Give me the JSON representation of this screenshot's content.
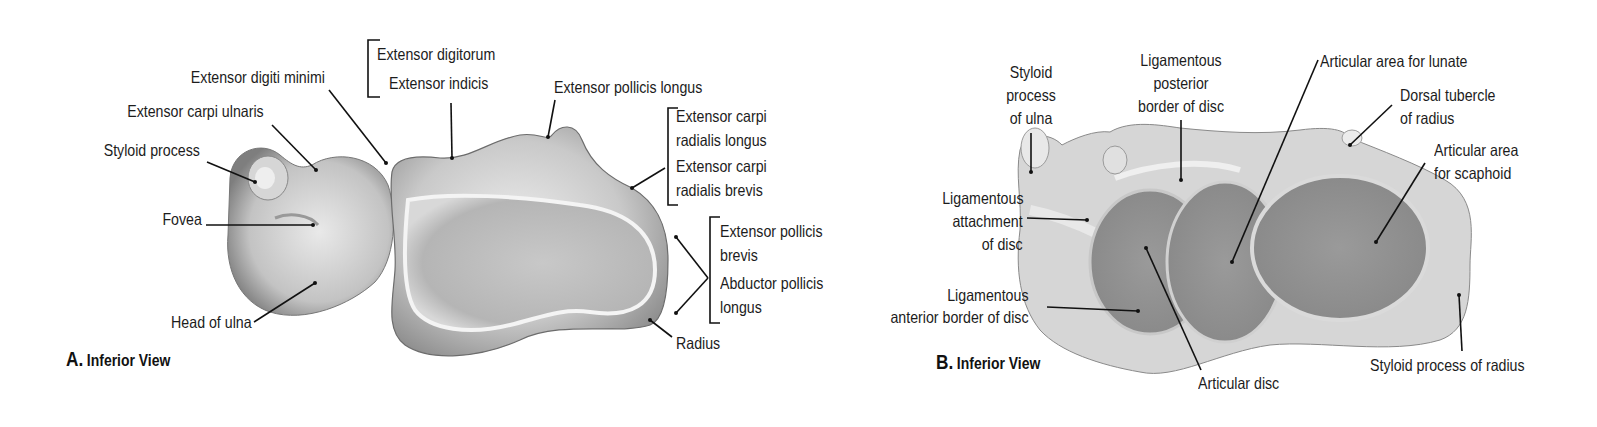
{
  "panel_a": {
    "caption_letter": "A.",
    "caption_view": "Inferior View",
    "labels": {
      "extensor_digitorum": "Extensor digitorum",
      "extensor_indicis": "Extensor indicis",
      "extensor_digiti_minimi": "Extensor digiti minimi",
      "extensor_carpi_ulnaris": "Extensor carpi ulnaris",
      "styloid_process": "Styloid process",
      "fovea": "Fovea",
      "head_of_ulna": "Head of ulna",
      "extensor_pollicis_longus": "Extensor pollicis longus",
      "ecrl_line1": "Extensor carpi",
      "ecrl_line2": "radialis longus",
      "ecrb_line1": "Extensor carpi",
      "ecrb_line2": "radialis brevis",
      "epb_line1": "Extensor pollicis",
      "epb_line2": "brevis",
      "apl_line1": "Abductor pollicis",
      "apl_line2": "longus",
      "radius": "Radius"
    }
  },
  "panel_b": {
    "caption_letter": "B.",
    "caption_view": "Inferior View",
    "labels": {
      "styloid_ulna_line1": "Styloid",
      "styloid_ulna_line2": "process",
      "styloid_ulna_line3": "of ulna",
      "lig_post_line1": "Ligamentous",
      "lig_post_line2": "posterior",
      "lig_post_line3": "border of disc",
      "articular_lunate": "Articular area for lunate",
      "dorsal_tubercle_line1": "Dorsal tubercle",
      "dorsal_tubercle_line2": "of radius",
      "articular_scaphoid_line1": "Articular area",
      "articular_scaphoid_line2": "for scaphoid",
      "lig_attach_line1": "Ligamentous",
      "lig_attach_line2": "attachment",
      "lig_attach_line3": "of disc",
      "lig_ant_line1": "Ligamentous",
      "lig_ant_line2": "anterior border of disc",
      "articular_disc": "Articular disc",
      "styloid_radius": "Styloid process of radius"
    }
  }
}
